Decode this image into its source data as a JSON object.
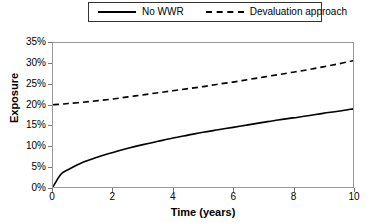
{
  "chart_data": {
    "type": "line",
    "title": "",
    "xlabel": "Time (years)",
    "ylabel": "Exposure",
    "xlim": [
      0,
      10
    ],
    "ylim": [
      0,
      35
    ],
    "grid": false,
    "legend_position": "top",
    "xticks": [
      0,
      2,
      4,
      6,
      8,
      10
    ],
    "xtick_labels": [
      "0",
      "2",
      "4",
      "6",
      "8",
      "10"
    ],
    "yticks": [
      0,
      5,
      10,
      15,
      20,
      25,
      30,
      35
    ],
    "ytick_labels": [
      "0%",
      "5%",
      "10%",
      "15%",
      "20%",
      "25%",
      "30%",
      "35%"
    ],
    "x": [
      0,
      0.25,
      0.5,
      1,
      1.5,
      2,
      2.5,
      3,
      3.5,
      4,
      4.5,
      5,
      5.5,
      6,
      6.5,
      7,
      7.5,
      8,
      8.5,
      9,
      9.5,
      10
    ],
    "series": [
      {
        "name": "No WWR",
        "style": "solid",
        "color": "#000000",
        "values": [
          0,
          3.0,
          4.2,
          6.0,
          7.3,
          8.4,
          9.4,
          10.3,
          11.1,
          11.9,
          12.6,
          13.3,
          13.9,
          14.5,
          15.1,
          15.7,
          16.3,
          16.8,
          17.3,
          17.9,
          18.4,
          19.0
        ]
      },
      {
        "name": "Devaluation approach",
        "style": "dashed",
        "color": "#000000",
        "values": [
          20.0,
          20.1,
          20.3,
          20.6,
          21.0,
          21.4,
          21.9,
          22.4,
          22.9,
          23.4,
          23.9,
          24.4,
          25.0,
          25.5,
          26.1,
          26.7,
          27.3,
          27.9,
          28.5,
          29.2,
          29.9,
          30.7
        ]
      }
    ]
  },
  "legend": {
    "entries": [
      {
        "label": "No WWR"
      },
      {
        "label": "Devaluation approach"
      }
    ]
  }
}
